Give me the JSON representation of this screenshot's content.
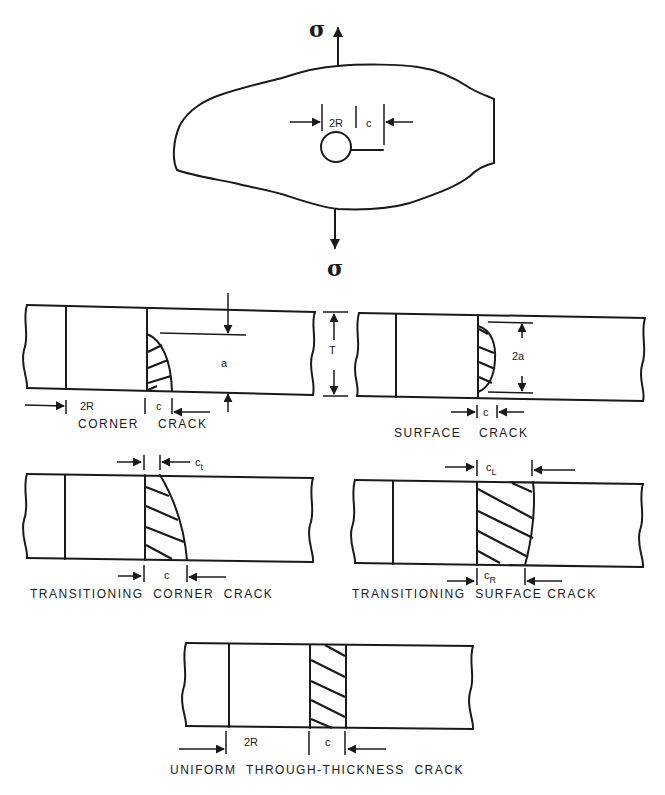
{
  "plate": {
    "load_top": "σ",
    "load_bottom": "σ",
    "dim_hole": "2R",
    "dim_crack": "c"
  },
  "panels": [
    {
      "id": "corner-crack",
      "caption_left": "CORNER",
      "caption_right": "CRACK",
      "dims": {
        "hole": "2R",
        "crack_length": "c",
        "crack_depth": "a",
        "thickness": "T"
      }
    },
    {
      "id": "surface-crack",
      "caption_left": "SURFACE",
      "caption_right": "CRACK",
      "dims": {
        "crack_length": "c",
        "crack_depth": "2a"
      }
    },
    {
      "id": "transitioning-corner-crack",
      "caption": "TRANSITIONING  CORNER  CRACK",
      "dims": {
        "top_length": "c",
        "top_sub": "t",
        "bottom_length": "c"
      }
    },
    {
      "id": "transitioning-surface-crack",
      "caption": "TRANSITIONING  SURFACE CRACK",
      "dims": {
        "left_length": "c",
        "left_sub": "L",
        "right_length": "c",
        "right_sub": "R"
      }
    },
    {
      "id": "uniform-through-thickness-crack",
      "caption": "UNIFORM  THROUGH-THICKNESS  CRACK",
      "dims": {
        "hole": "2R",
        "crack_length": "c"
      }
    }
  ]
}
